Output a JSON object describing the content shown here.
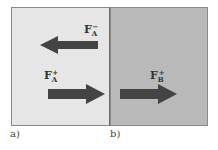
{
  "diagram": {
    "panels": [
      {
        "id": "a",
        "caption": "a)",
        "fill": "#e6e6e6"
      },
      {
        "id": "b",
        "caption": "b)",
        "fill": "#b9b9b9"
      }
    ],
    "arrows": [
      {
        "panel": "a",
        "direction": "left",
        "label": {
          "base": "F",
          "sub": "A",
          "sup": "−"
        }
      },
      {
        "panel": "a",
        "direction": "right",
        "label": {
          "base": "F",
          "sub": "A",
          "sup": "+"
        }
      },
      {
        "panel": "b",
        "direction": "right",
        "label": {
          "base": "F",
          "sub": "B",
          "sup": "+"
        }
      }
    ],
    "arrow_color": "#444444"
  }
}
